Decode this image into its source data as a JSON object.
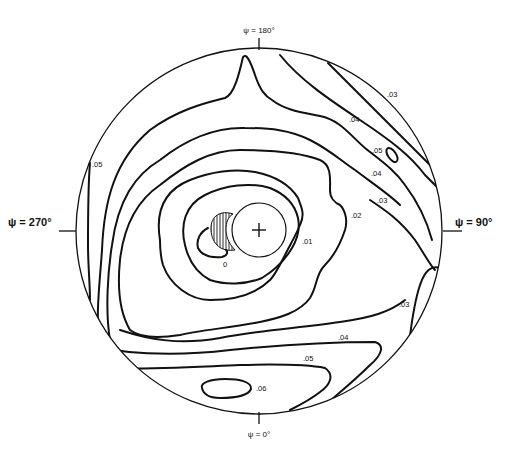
{
  "diagram": {
    "type": "polar contour map",
    "axis_labels": {
      "top": "ψ = 180°",
      "right": "ψ = 90°",
      "bottom": "ψ = 0°",
      "left": "ψ = 270°"
    },
    "contour_labels": [
      {
        "id": "c03_top",
        "text": ".03"
      },
      {
        "id": "c04_top",
        "text": ".04"
      },
      {
        "id": "c05_island",
        "text": ".05"
      },
      {
        "id": "c04_mid",
        "text": ".04"
      },
      {
        "id": "c03_mid",
        "text": ".03"
      },
      {
        "id": "c02",
        "text": ".02"
      },
      {
        "id": "c01",
        "text": ".01"
      },
      {
        "id": "c0",
        "text": "0"
      },
      {
        "id": "c05_left",
        "text": ".05"
      },
      {
        "id": "c03_right",
        "text": ".03"
      },
      {
        "id": "c04_bottom",
        "text": ".04"
      },
      {
        "id": "c05_bottom",
        "text": ".05"
      },
      {
        "id": "c06",
        "text": ".06"
      }
    ],
    "markers": {
      "center_symbol": "+",
      "hatched_region": "shaded crescent left of center circle"
    },
    "colors": {
      "line": "#111111",
      "background": "#ffffff"
    }
  }
}
